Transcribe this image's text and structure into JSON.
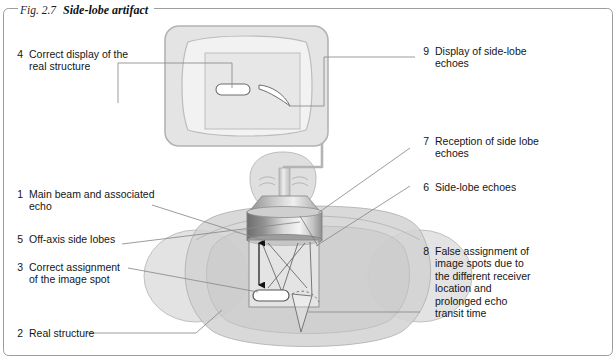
{
  "figure": {
    "number": "Fig. 2.7",
    "title": "Side-lobe artifact"
  },
  "colors": {
    "frame_border": "#9a9a9a",
    "line": "#7d7d7d",
    "body_fill": "#d6d6d6",
    "body_stroke": "#b0b0b0",
    "monitor_fill": "#e2e2e2",
    "screen_fill": "#e8e8e8",
    "transducer_dark": "#6f6f6f",
    "transducer_light": "#f2f2f2",
    "text": "#151515"
  },
  "legend": [
    {
      "id": "1",
      "number": "1",
      "text": "Main beam and associated\necho"
    },
    {
      "id": "2",
      "number": "2",
      "text": "Real structure"
    },
    {
      "id": "3",
      "number": "3",
      "text": "Correct assignment\nof the image spot"
    },
    {
      "id": "4",
      "number": "4",
      "text": "Correct display of the\nreal structure"
    },
    {
      "id": "5",
      "number": "5",
      "text": "Off-axis side lobes"
    },
    {
      "id": "6",
      "number": "6",
      "text": "Side-lobe echoes"
    },
    {
      "id": "7",
      "number": "7",
      "text": "Reception of side lobe\nechoes"
    },
    {
      "id": "8",
      "number": "8",
      "text": "False assignment of\nimage spots due to\nthe different receiver\nlocation and\nprolonged echo\ntransit time"
    },
    {
      "id": "9",
      "number": "9",
      "text": "Display of side-lobe\nechoes"
    }
  ],
  "artwork": {
    "monitor_name": "ultrasound-monitor",
    "screen_real_structure": "capsule-shape",
    "screen_side_lobe_artifact": "curved-arc",
    "transducer_name": "ultrasound-transducer",
    "patient_name": "patient-torso-top-view",
    "head_name": "patient-head",
    "scan_sector_name": "scan-sector-box",
    "main_beam_name": "main-beam-path",
    "side_lobe_name": "off-axis-side-lobe-path",
    "target_name": "real-structure-target",
    "false_spot_name": "false-image-spot"
  }
}
